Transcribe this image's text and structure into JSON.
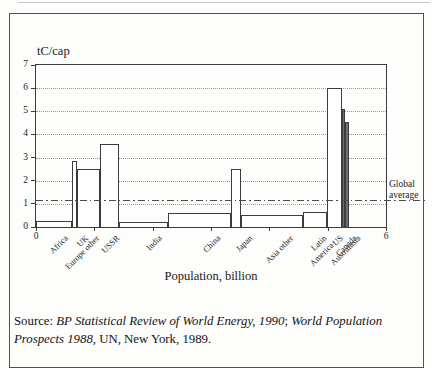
{
  "figure": {
    "y_axis_title": "tC/cap",
    "x_axis_label": "Population, billion"
  },
  "chart_data": {
    "type": "bar",
    "variant": "variable-width-bars (bar width = population, bar height = per-capita carbon emissions)",
    "xlabel": "Population, billion",
    "ylabel": "tC/cap",
    "xlim": [
      0,
      6
    ],
    "ylim": [
      0,
      7
    ],
    "x_ticks": [
      0,
      1,
      2,
      3,
      4,
      5,
      6
    ],
    "x_labeled_ticks": [
      0,
      6
    ],
    "y_ticks": [
      0,
      1,
      2,
      3,
      4,
      5,
      6,
      7
    ],
    "grid_values": [
      1,
      2,
      3,
      4,
      5,
      6
    ],
    "grid_style": "dotted",
    "categories": [
      "Africa",
      "UK",
      "Europe other",
      "USSR",
      "India",
      "China",
      "Japan",
      "Asia other",
      "Latin\nAmerica",
      "US",
      "Canada",
      "Australasia"
    ],
    "pop_billion": [
      0.62,
      0.08,
      0.4,
      0.33,
      0.84,
      1.08,
      0.17,
      1.06,
      0.41,
      0.25,
      0.06,
      0.07
    ],
    "tc_per_cap": [
      0.25,
      2.85,
      2.5,
      3.6,
      0.2,
      0.6,
      2.5,
      0.5,
      0.65,
      6.0,
      5.1,
      4.55
    ],
    "narrow_dark_bars": [
      "Canada",
      "Australasia"
    ],
    "reference_line": {
      "label": "Global average",
      "value": 1.15,
      "style": "dash-dot"
    },
    "line_color": "#3c3c3c",
    "bar_fill": "#ffffff"
  },
  "source": {
    "line1": {
      "prefix": "Source: ",
      "italic_a": "BP Statistical Review of World Energy, 1990",
      "sep": "; ",
      "italic_b": "World Population"
    },
    "line2": {
      "italic": "Prospects 1988",
      "rest": ", UN, New York, 1989."
    }
  }
}
